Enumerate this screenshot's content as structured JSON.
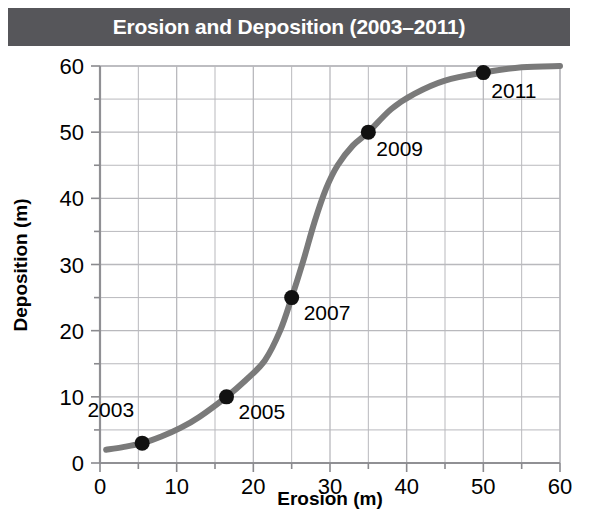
{
  "title": "Erosion and Deposition (2003–2011)",
  "colors": {
    "banner_bg": "#56565a",
    "banner_text": "#ffffff",
    "curve": "#7a7a7a",
    "point": "#111111",
    "grid": "#b9b9bd",
    "axis": "#8a8a8e",
    "text": "#000000",
    "background": "#ffffff"
  },
  "chart_data": {
    "type": "line",
    "title": "Erosion and Deposition (2003–2011)",
    "xlabel": "Erosion (m)",
    "ylabel": "Deposition (m)",
    "xlim": [
      0,
      60
    ],
    "ylim": [
      0,
      60
    ],
    "xticks": [
      0,
      10,
      20,
      30,
      40,
      50,
      60
    ],
    "yticks": [
      0,
      10,
      20,
      30,
      40,
      50,
      60
    ],
    "xtick_labels": [
      "0",
      "10",
      "20",
      "30",
      "40",
      "50",
      "60"
    ],
    "ytick_labels": [
      "0",
      "10",
      "20",
      "30",
      "40",
      "50",
      "60"
    ],
    "minor_tick_step": 5,
    "grid": true,
    "grid_step": 5,
    "legend": null,
    "series": [
      {
        "name": "Erosion vs Deposition",
        "style": "smooth-curve",
        "x": [
          0.8,
          3,
          5.5,
          8,
          10.5,
          13,
          16.5,
          19,
          21.5,
          23.5,
          25,
          26.5,
          28,
          29.5,
          31,
          33,
          35,
          38,
          41,
          45,
          50,
          55,
          60
        ],
        "y": [
          2.0,
          2.4,
          3.0,
          4.0,
          5.3,
          7.0,
          10.0,
          12.5,
          15.5,
          20.0,
          25.0,
          30.5,
          36.5,
          41.5,
          45.0,
          48.0,
          50.0,
          53.5,
          55.8,
          57.8,
          59.0,
          59.8,
          60.0
        ]
      }
    ],
    "points": [
      {
        "label": "2003",
        "x": 5.5,
        "y": 3.0,
        "label_dx": -8,
        "label_dy": -26,
        "label_anchor": "end"
      },
      {
        "label": "2005",
        "x": 16.5,
        "y": 10.0,
        "label_dx": 12,
        "label_dy": 22,
        "label_anchor": "start"
      },
      {
        "label": "2007",
        "x": 25.0,
        "y": 25.0,
        "label_dx": 12,
        "label_dy": 22,
        "label_anchor": "start"
      },
      {
        "label": "2009",
        "x": 35.0,
        "y": 50.0,
        "label_dx": 8,
        "label_dy": 24,
        "label_anchor": "start"
      },
      {
        "label": "2011",
        "x": 50.0,
        "y": 59.0,
        "label_dx": 8,
        "label_dy": 25,
        "label_anchor": "start"
      }
    ]
  }
}
